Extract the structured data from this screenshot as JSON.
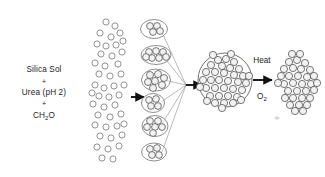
{
  "figure": {
    "background_color": "#ffffff",
    "width": 325,
    "height": 177
  },
  "reagents": {
    "name": "reagent-stack",
    "line1": "Silica Sol",
    "plus1": "+",
    "line2": "Urea (pH 2)",
    "plus2": "+",
    "line3_main": "CH",
    "line3_sub": "2",
    "line3_tail": "O",
    "line3_full": "CH2O"
  },
  "conditions": {
    "name": "calcination-conditions",
    "heat_label": "Heat",
    "gas_main": "O",
    "gas_sub": "2",
    "gas_full": "O2"
  },
  "stages": [
    {
      "id": "stage-sol-dispersion",
      "label": "dispersed silica sol particles",
      "particle_count": 44,
      "particle_radius": 3.1,
      "style": "open-circle"
    },
    {
      "id": "stage-primary-clusters",
      "label": "encapsulated primary clusters",
      "cluster_count": 6,
      "particles_per_cluster": [
        4,
        7,
        7,
        4,
        6,
        4
      ],
      "style": "shelled-aggregate"
    },
    {
      "id": "stage-assembled-sphere",
      "label": "assembled mesoporous sphere",
      "sphere_radius": 27,
      "particle_count": 40,
      "particle_radius": 3.6,
      "style": "packed-sphere"
    },
    {
      "id": "stage-calcined-cluster",
      "label": "calcined porous cluster",
      "particle_count": 40,
      "particle_radius": 3.6,
      "style": "packed-free"
    }
  ],
  "arrows": [
    {
      "id": "arrow-sol-to-clusters",
      "direction": "right"
    },
    {
      "id": "arrow-clusters-to-sphere",
      "direction": "right"
    },
    {
      "id": "arrow-heat-calcination",
      "direction": "right"
    }
  ],
  "colors": {
    "particle_stroke": "#6d6d6d",
    "shell_stroke": "#7a7a7a",
    "ray_stroke": "#8a8a8a",
    "arrow": "#111111",
    "text": "#1c1c1c"
  }
}
